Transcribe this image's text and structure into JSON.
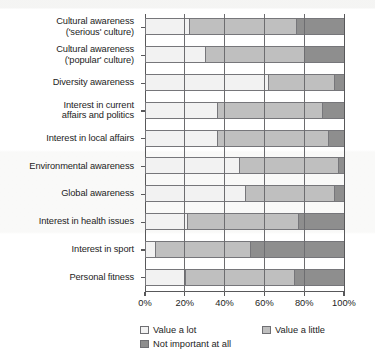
{
  "chart_data": {
    "type": "bar",
    "orientation": "horizontal",
    "stacked": true,
    "normalized_percent": true,
    "title": "",
    "xlabel": "",
    "ylabel": "",
    "xlim": [
      0,
      100
    ],
    "xticks": [
      0,
      20,
      40,
      60,
      80,
      100
    ],
    "xticklabels": [
      "0%",
      "20%",
      "40%",
      "60%",
      "80%",
      "100%"
    ],
    "grid": true,
    "legend_position": "bottom",
    "categories": [
      "Cultural awareness ('serious' culture)",
      "Cultural awareness ('popular' culture)",
      "Diversity awareness",
      "Interest in current affairs and politics",
      "Interest in local affairs",
      "Environmental awareness",
      "Global awareness",
      "Interest in health issues",
      "Interest in sport",
      "Personal fitness"
    ],
    "category_lines": [
      [
        "Cultural awareness",
        "('serious' culture)"
      ],
      [
        "Cultural awareness",
        "('popular' culture)"
      ],
      [
        "Diversity awareness"
      ],
      [
        "Interest in current",
        "affairs and politics"
      ],
      [
        "Interest in local affairs"
      ],
      [
        "Environmental awareness"
      ],
      [
        "Global awareness"
      ],
      [
        "Interest in health issues"
      ],
      [
        "Interest in sport"
      ],
      [
        "Personal fitness"
      ]
    ],
    "series": [
      {
        "name": "Value a lot",
        "color": "#f2f2f2",
        "values": [
          22,
          30,
          62,
          36,
          36,
          47,
          50,
          21,
          5,
          20
        ]
      },
      {
        "name": "Value a little",
        "color": "#bfbfbf",
        "values": [
          54,
          50,
          33,
          53,
          56,
          50,
          45,
          56,
          48,
          55
        ]
      },
      {
        "name": "Not important at all",
        "color": "#8e8e8e",
        "values": [
          24,
          20,
          5,
          11,
          8,
          3,
          5,
          23,
          47,
          25
        ]
      }
    ]
  },
  "legend": {
    "items": [
      {
        "label": "Value a lot",
        "color": "#f2f2f2"
      },
      {
        "label": "Value a little",
        "color": "#bfbfbf"
      },
      {
        "label": "Not important at all",
        "color": "#8e8e8e"
      }
    ]
  }
}
